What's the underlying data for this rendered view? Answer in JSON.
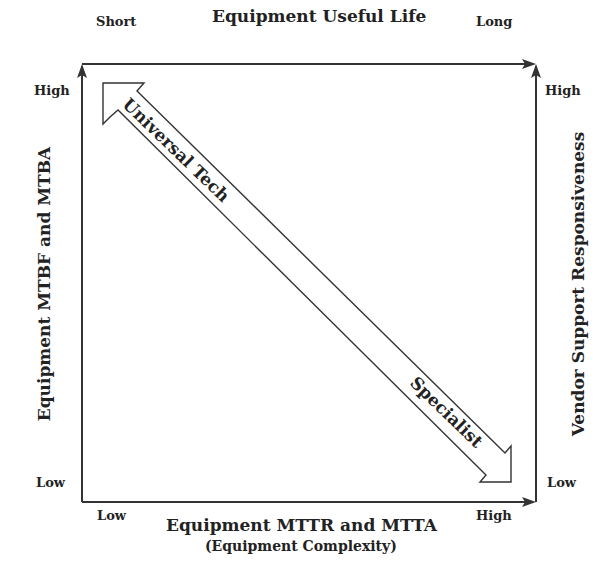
{
  "diagram": {
    "top_axis": {
      "title": "Equipment Useful Life",
      "start_label": "Short",
      "end_label": "Long"
    },
    "bottom_axis": {
      "title": "Equipment MTTR and MTTA",
      "subtitle": "(Equipment Complexity)",
      "start_label": "Low",
      "end_label": "High"
    },
    "left_axis": {
      "title": "Equipment MTBF and MTBA",
      "top_label": "High",
      "bottom_label": "Low"
    },
    "right_axis": {
      "title": "Vendor Support Responsiveness",
      "top_label": "High",
      "bottom_label": "Low"
    },
    "double_arrow": {
      "upper_label": "Universal Tech",
      "lower_label": "Specialist"
    },
    "colors": {
      "line": "#333333",
      "background": "#ffffff"
    }
  }
}
